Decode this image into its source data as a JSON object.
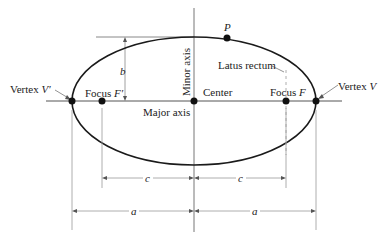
{
  "diagram": {
    "type": "ellipse-anatomy",
    "labels": {
      "vertex_left": "Vertex ",
      "vertex_left_sym": "V′",
      "vertex_right": "Vertex ",
      "vertex_right_sym": "V",
      "focus_left": "Focus ",
      "focus_left_sym": "F′",
      "focus_right": "Focus ",
      "focus_right_sym": "F",
      "center": "Center",
      "major_axis": "Major axis",
      "minor_axis": "Minor axis",
      "latus_rectum": "Latus rectum",
      "point": "P",
      "semi_minor": "b",
      "focal_distance_left": "c",
      "focal_distance_right": "c",
      "semi_major_left": "a",
      "semi_major_right": "a"
    },
    "colors": {
      "curve": "#1a1a1a",
      "guide": "#888888",
      "text": "#222222"
    }
  }
}
